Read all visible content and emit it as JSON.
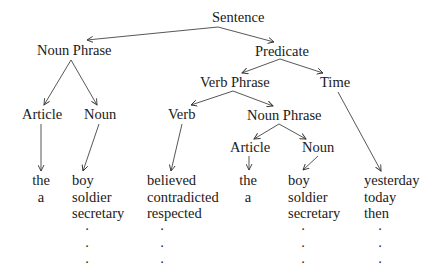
{
  "diagram": {
    "type": "syntax-tree",
    "nodes": {
      "sentence": "Sentence",
      "noun_phrase_1": "Noun Phrase",
      "predicate": "Predicate",
      "verb_phrase": "Verb Phrase",
      "time": "Time",
      "article_1": "Article",
      "noun_1": "Noun",
      "verb": "Verb",
      "noun_phrase_2": "Noun Phrase",
      "article_2": "Article",
      "noun_2": "Noun"
    },
    "leaves": {
      "article_1": [
        "the",
        "a"
      ],
      "noun_1": [
        "boy",
        "soldier",
        "secretary"
      ],
      "verb": [
        "believed",
        "contradicted",
        "respected"
      ],
      "article_2": [
        "the",
        "a"
      ],
      "noun_2": [
        "boy",
        "soldier",
        "secretary"
      ],
      "time": [
        "yesterday",
        "today",
        "then"
      ]
    },
    "ellipsis": [
      "·",
      "·",
      "·"
    ],
    "edges": [
      [
        "Sentence",
        "Noun Phrase"
      ],
      [
        "Sentence",
        "Predicate"
      ],
      [
        "Noun Phrase",
        "Article"
      ],
      [
        "Noun Phrase",
        "Noun"
      ],
      [
        "Predicate",
        "Verb Phrase"
      ],
      [
        "Predicate",
        "Time"
      ],
      [
        "Verb Phrase",
        "Verb"
      ],
      [
        "Verb Phrase",
        "Noun Phrase"
      ],
      [
        "Noun Phrase",
        "Article"
      ],
      [
        "Noun Phrase",
        "Noun"
      ],
      [
        "Article",
        "the/a"
      ],
      [
        "Noun",
        "boy/soldier/secretary"
      ],
      [
        "Verb",
        "believed/contradicted/respected"
      ],
      [
        "Article",
        "the/a"
      ],
      [
        "Noun",
        "boy/soldier/secretary"
      ],
      [
        "Time",
        "yesterday/today/then"
      ]
    ]
  }
}
